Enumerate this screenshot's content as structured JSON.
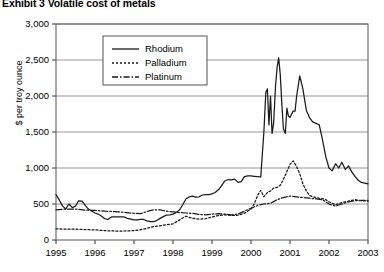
{
  "chart_data": {
    "type": "line",
    "title": "Exhibit 3  Volatile cost of metals",
    "xlabel": "",
    "ylabel": "$ per troy ounce",
    "xlim": [
      1995,
      2003
    ],
    "ylim": [
      0,
      3000
    ],
    "ytick_values": [
      0,
      500,
      1000,
      1500,
      2000,
      2500,
      3000
    ],
    "ytick_labels": [
      "0",
      "500",
      "1,000",
      "1,500",
      "2,000",
      "2,500",
      "3,000"
    ],
    "xtick_values": [
      1995,
      1996,
      1997,
      1998,
      1999,
      2000,
      2001,
      2002,
      2003
    ],
    "xtick_labels": [
      "1995",
      "1996",
      "1997",
      "1998",
      "1999",
      "2000",
      "2001",
      "2002",
      "2003"
    ],
    "grid": "horizontal",
    "legend_position": "top-center",
    "series": [
      {
        "name": "Rhodium",
        "style": "solid",
        "color": "#1a1a1a",
        "points": [
          [
            1995.0,
            630
          ],
          [
            1995.08,
            560
          ],
          [
            1995.17,
            470
          ],
          [
            1995.25,
            430
          ],
          [
            1995.33,
            500
          ],
          [
            1995.42,
            450
          ],
          [
            1995.5,
            470
          ],
          [
            1995.58,
            545
          ],
          [
            1995.67,
            540
          ],
          [
            1995.75,
            480
          ],
          [
            1995.83,
            430
          ],
          [
            1995.92,
            400
          ],
          [
            1996.0,
            375
          ],
          [
            1996.08,
            360
          ],
          [
            1996.17,
            330
          ],
          [
            1996.25,
            295
          ],
          [
            1996.33,
            285
          ],
          [
            1996.42,
            320
          ],
          [
            1996.5,
            320
          ],
          [
            1996.58,
            320
          ],
          [
            1996.67,
            320
          ],
          [
            1996.75,
            320
          ],
          [
            1996.83,
            300
          ],
          [
            1996.92,
            290
          ],
          [
            1997.0,
            280
          ],
          [
            1997.08,
            280
          ],
          [
            1997.17,
            285
          ],
          [
            1997.25,
            285
          ],
          [
            1997.33,
            265
          ],
          [
            1997.42,
            255
          ],
          [
            1997.5,
            255
          ],
          [
            1997.58,
            270
          ],
          [
            1997.67,
            300
          ],
          [
            1997.75,
            325
          ],
          [
            1997.83,
            345
          ],
          [
            1997.92,
            350
          ],
          [
            1998.0,
            360
          ],
          [
            1998.08,
            380
          ],
          [
            1998.17,
            420
          ],
          [
            1998.25,
            490
          ],
          [
            1998.33,
            570
          ],
          [
            1998.42,
            600
          ],
          [
            1998.5,
            610
          ],
          [
            1998.58,
            595
          ],
          [
            1998.67,
            600
          ],
          [
            1998.75,
            625
          ],
          [
            1998.83,
            630
          ],
          [
            1998.92,
            630
          ],
          [
            1999.0,
            640
          ],
          [
            1999.08,
            660
          ],
          [
            1999.17,
            700
          ],
          [
            1999.25,
            760
          ],
          [
            1999.33,
            820
          ],
          [
            1999.42,
            840
          ],
          [
            1999.5,
            835
          ],
          [
            1999.58,
            845
          ],
          [
            1999.67,
            800
          ],
          [
            1999.75,
            810
          ],
          [
            1999.83,
            880
          ],
          [
            1999.92,
            890
          ],
          [
            2000.0,
            890
          ],
          [
            2000.08,
            885
          ],
          [
            2000.17,
            880
          ],
          [
            2000.25,
            875
          ],
          [
            2000.33,
            1500
          ],
          [
            2000.38,
            2050
          ],
          [
            2000.42,
            2100
          ],
          [
            2000.46,
            1600
          ],
          [
            2000.5,
            2000
          ],
          [
            2000.54,
            1480
          ],
          [
            2000.58,
            1620
          ],
          [
            2000.63,
            2150
          ],
          [
            2000.67,
            2400
          ],
          [
            2000.71,
            2530
          ],
          [
            2000.75,
            2300
          ],
          [
            2000.79,
            1900
          ],
          [
            2000.83,
            1550
          ],
          [
            2000.88,
            1480
          ],
          [
            2000.92,
            1830
          ],
          [
            2000.96,
            1720
          ],
          [
            2001.0,
            1700
          ],
          [
            2001.08,
            1790
          ],
          [
            2001.13,
            1790
          ],
          [
            2001.17,
            2000
          ],
          [
            2001.25,
            2280
          ],
          [
            2001.33,
            2100
          ],
          [
            2001.42,
            1800
          ],
          [
            2001.5,
            1700
          ],
          [
            2001.58,
            1640
          ],
          [
            2001.67,
            1620
          ],
          [
            2001.75,
            1600
          ],
          [
            2001.83,
            1400
          ],
          [
            2001.92,
            1150
          ],
          [
            2002.0,
            1000
          ],
          [
            2002.08,
            960
          ],
          [
            2002.17,
            1060
          ],
          [
            2002.25,
            1000
          ],
          [
            2002.33,
            1080
          ],
          [
            2002.42,
            980
          ],
          [
            2002.5,
            1030
          ],
          [
            2002.58,
            950
          ],
          [
            2002.67,
            880
          ],
          [
            2002.75,
            830
          ],
          [
            2002.83,
            800
          ],
          [
            2002.92,
            790
          ],
          [
            2003.0,
            780
          ]
        ]
      },
      {
        "name": "Palladium",
        "style": "dotted",
        "color": "#1a1a1a",
        "points": [
          [
            1995.0,
            155
          ],
          [
            1995.25,
            150
          ],
          [
            1995.5,
            150
          ],
          [
            1995.75,
            145
          ],
          [
            1996.0,
            140
          ],
          [
            1996.25,
            130
          ],
          [
            1996.5,
            125
          ],
          [
            1996.75,
            125
          ],
          [
            1997.0,
            130
          ],
          [
            1997.25,
            150
          ],
          [
            1997.5,
            185
          ],
          [
            1997.75,
            205
          ],
          [
            1998.0,
            225
          ],
          [
            1998.17,
            280
          ],
          [
            1998.33,
            330
          ],
          [
            1998.5,
            300
          ],
          [
            1998.67,
            290
          ],
          [
            1998.83,
            295
          ],
          [
            1999.0,
            320
          ],
          [
            1999.17,
            340
          ],
          [
            1999.33,
            350
          ],
          [
            1999.5,
            340
          ],
          [
            1999.67,
            345
          ],
          [
            1999.83,
            370
          ],
          [
            2000.0,
            430
          ],
          [
            2000.08,
            500
          ],
          [
            2000.17,
            620
          ],
          [
            2000.25,
            690
          ],
          [
            2000.33,
            600
          ],
          [
            2000.42,
            660
          ],
          [
            2000.5,
            680
          ],
          [
            2000.58,
            720
          ],
          [
            2000.67,
            730
          ],
          [
            2000.75,
            760
          ],
          [
            2000.83,
            840
          ],
          [
            2000.92,
            950
          ],
          [
            2001.0,
            1050
          ],
          [
            2001.08,
            1100
          ],
          [
            2001.17,
            1020
          ],
          [
            2001.25,
            920
          ],
          [
            2001.33,
            780
          ],
          [
            2001.42,
            680
          ],
          [
            2001.5,
            620
          ],
          [
            2001.58,
            600
          ],
          [
            2001.67,
            590
          ],
          [
            2001.75,
            580
          ],
          [
            2001.83,
            575
          ],
          [
            2001.92,
            560
          ],
          [
            2002.0,
            530
          ],
          [
            2002.17,
            490
          ],
          [
            2002.33,
            520
          ],
          [
            2002.5,
            540
          ],
          [
            2002.67,
            560
          ],
          [
            2002.83,
            545
          ],
          [
            2003.0,
            540
          ]
        ]
      },
      {
        "name": "Platinum",
        "style": "dash-dot",
        "color": "#1a1a1a",
        "points": [
          [
            1995.0,
            420
          ],
          [
            1995.25,
            430
          ],
          [
            1995.5,
            430
          ],
          [
            1995.75,
            415
          ],
          [
            1996.0,
            410
          ],
          [
            1996.25,
            400
          ],
          [
            1996.5,
            395
          ],
          [
            1996.75,
            385
          ],
          [
            1997.0,
            370
          ],
          [
            1997.17,
            365
          ],
          [
            1997.33,
            395
          ],
          [
            1997.5,
            420
          ],
          [
            1997.67,
            420
          ],
          [
            1997.83,
            400
          ],
          [
            1998.0,
            390
          ],
          [
            1998.17,
            380
          ],
          [
            1998.33,
            375
          ],
          [
            1998.5,
            370
          ],
          [
            1998.67,
            355
          ],
          [
            1998.83,
            350
          ],
          [
            1999.0,
            360
          ],
          [
            1999.17,
            365
          ],
          [
            1999.33,
            360
          ],
          [
            1999.5,
            350
          ],
          [
            1999.67,
            360
          ],
          [
            1999.83,
            400
          ],
          [
            2000.0,
            440
          ],
          [
            2000.17,
            480
          ],
          [
            2000.33,
            500
          ],
          [
            2000.5,
            510
          ],
          [
            2000.67,
            560
          ],
          [
            2000.83,
            590
          ],
          [
            2001.0,
            610
          ],
          [
            2001.17,
            600
          ],
          [
            2001.33,
            590
          ],
          [
            2001.5,
            580
          ],
          [
            2001.67,
            570
          ],
          [
            2001.83,
            560
          ],
          [
            2002.0,
            500
          ],
          [
            2002.17,
            470
          ],
          [
            2002.33,
            500
          ],
          [
            2002.5,
            530
          ],
          [
            2002.67,
            545
          ],
          [
            2002.83,
            550
          ],
          [
            2003.0,
            550
          ]
        ]
      }
    ]
  }
}
